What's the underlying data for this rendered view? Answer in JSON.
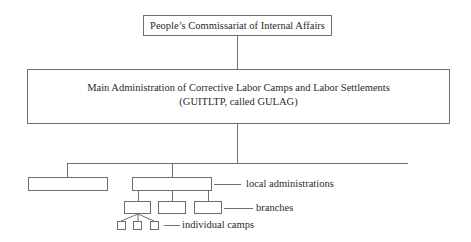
{
  "diagram": {
    "type": "org-chart",
    "nodes": {
      "top": {
        "label": "People’s Commissariat of Internal Affairs"
      },
      "main": {
        "line1": "Main Administration of Corrective Labor Camps and Labor Settlements",
        "line2": "(GUITLTP, called GULAG)"
      },
      "unlabeled_unit": {
        "label": ""
      },
      "local_administration": {
        "label": ""
      },
      "branches": [
        {
          "label": ""
        },
        {
          "label": ""
        },
        {
          "label": ""
        }
      ],
      "camps": [
        {
          "label": ""
        },
        {
          "label": ""
        },
        {
          "label": ""
        }
      ]
    },
    "legend": {
      "local_administrations": "local administrations",
      "branches": "branches",
      "individual_camps": "individual camps"
    },
    "edges": [
      [
        "top",
        "main"
      ],
      [
        "main",
        "unlabeled_unit"
      ],
      [
        "main",
        "local_administration"
      ],
      [
        "local_administration",
        "branch-1"
      ],
      [
        "local_administration",
        "branch-2"
      ],
      [
        "local_administration",
        "branch-3"
      ],
      [
        "branch-1",
        "camp-1"
      ],
      [
        "branch-1",
        "camp-2"
      ],
      [
        "branch-1",
        "camp-3"
      ]
    ],
    "colors": {
      "line": "#707070",
      "text": "#2a2a2a",
      "background": "#ffffff"
    }
  }
}
